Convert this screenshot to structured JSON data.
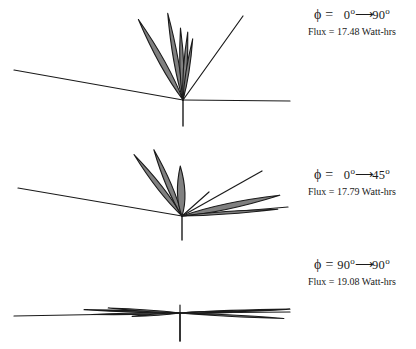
{
  "figure": {
    "type": "radiation-lobe-diagram",
    "stroke_color": "#1a1a1a",
    "lobe_fill_color": "#808080",
    "background_color": "#ffffff",
    "panels": [
      {
        "id": "panel-1",
        "phi_prefix": "ϕ =",
        "phi_from": "0",
        "phi_to": "90",
        "degree_symbol": "o",
        "arrow": "⟶",
        "flux_label": "Flux = 17.48 Watt-hrs",
        "flux_value": 17.48,
        "flux_units": "Watt-hrs",
        "origin": {
          "x": 183,
          "y": 100
        },
        "axis_stub_bottom_y": 126,
        "rays": [
          {
            "x1": 14,
            "y1": 70,
            "x2": 183,
            "y2": 100
          },
          {
            "x1": 183,
            "y1": 100,
            "x2": 290,
            "y2": 101
          },
          {
            "x1": 183,
            "y1": 100,
            "x2": 243,
            "y2": 16
          }
        ],
        "lobes": [
          {
            "angle_deg": 119,
            "length": 92,
            "width": 11
          },
          {
            "angle_deg": 100,
            "length": 88,
            "width": 9
          },
          {
            "angle_deg": 92,
            "length": 72,
            "width": 8
          },
          {
            "angle_deg": 86,
            "length": 68,
            "width": 7
          },
          {
            "angle_deg": 81,
            "length": 62,
            "width": 6
          }
        ]
      },
      {
        "id": "panel-2",
        "phi_prefix": "ϕ =",
        "phi_from": "0",
        "phi_to": "45",
        "degree_symbol": "o",
        "arrow": "⟶",
        "flux_label": "Flux = 17.79 Watt-hrs",
        "flux_value": 17.79,
        "flux_units": "Watt-hrs",
        "origin": {
          "x": 182,
          "y": 216
        },
        "axis_stub_bottom_y": 240,
        "rays": [
          {
            "x1": 18,
            "y1": 188,
            "x2": 182,
            "y2": 216
          },
          {
            "x1": 182,
            "y1": 216,
            "x2": 288,
            "y2": 207
          },
          {
            "x1": 182,
            "y1": 216,
            "x2": 262,
            "y2": 171
          },
          {
            "x1": 182,
            "y1": 216,
            "x2": 209,
            "y2": 192
          }
        ],
        "lobes": [
          {
            "angle_deg": 128,
            "length": 78,
            "width": 10
          },
          {
            "angle_deg": 113,
            "length": 72,
            "width": 10
          },
          {
            "angle_deg": 92,
            "length": 50,
            "width": 15
          },
          {
            "angle_deg": 12,
            "length": 100,
            "width": 11
          },
          {
            "angle_deg": 4,
            "length": 96,
            "width": 5
          }
        ]
      },
      {
        "id": "panel-3",
        "phi_prefix": "ϕ =",
        "phi_from": "90",
        "phi_to": "90",
        "degree_symbol": "o",
        "arrow": "⟶",
        "flux_label": "Flux = 19.08 Watt-hrs",
        "flux_value": 19.08,
        "flux_units": "Watt-hrs",
        "origin": {
          "x": 180,
          "y": 313
        },
        "axis_stub_bottom_y": 341,
        "rays": [
          {
            "x1": 14,
            "y1": 316,
            "x2": 180,
            "y2": 313
          },
          {
            "x1": 180,
            "y1": 313,
            "x2": 290,
            "y2": 312
          },
          {
            "x1": 180,
            "y1": 305,
            "x2": 180,
            "y2": 341
          }
        ],
        "lobes": [
          {
            "angle_deg": 178,
            "length": 96,
            "width": 3
          },
          {
            "angle_deg": 181,
            "length": 88,
            "width": 3
          },
          {
            "angle_deg": 176,
            "length": 72,
            "width": 3
          },
          {
            "angle_deg": 2,
            "length": 110,
            "width": 3
          },
          {
            "angle_deg": 357,
            "length": 104,
            "width": 3
          },
          {
            "angle_deg": 1,
            "length": 62,
            "width": 3
          },
          {
            "angle_deg": 184,
            "length": 48,
            "width": 3
          }
        ]
      }
    ]
  },
  "chart_data": {
    "type": "line",
    "title": "",
    "series": [
      {
        "name": "ϕ = 0° → 90°",
        "flux": 17.48,
        "units": "Watt-hrs"
      },
      {
        "name": "ϕ = 0° → 45°",
        "flux": 17.79,
        "units": "Watt-hrs"
      },
      {
        "name": "ϕ = 90° → 90°",
        "flux": 19.08,
        "units": "Watt-hrs"
      }
    ]
  }
}
